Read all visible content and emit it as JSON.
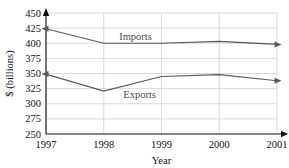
{
  "chart_data": {
    "type": "line",
    "title": "",
    "xlabel": "Year",
    "ylabel": "$ (billions)",
    "x": [
      1997,
      1998,
      1999,
      2000,
      2001
    ],
    "categories": [
      "1997",
      "1998",
      "1999",
      "2000",
      "2001"
    ],
    "xlim": [
      1997,
      2001
    ],
    "ylim": [
      250,
      450
    ],
    "yticks": [
      250,
      275,
      300,
      325,
      350,
      375,
      400,
      425,
      450
    ],
    "ytick_labels": [
      "250",
      "275",
      "300",
      "325",
      "350",
      "375",
      "400",
      "425",
      "450"
    ],
    "xtick_labels": [
      "1997",
      "1998",
      "1999",
      "2000",
      "2001"
    ],
    "grid": true,
    "legend_position": "inline-annotation",
    "series": [
      {
        "name": "Imports",
        "values": [
          424,
          400,
          400,
          403,
          398
        ],
        "color": "#595959",
        "label_text": "Imports"
      },
      {
        "name": "Exports",
        "values": [
          349,
          321,
          345,
          348,
          338
        ],
        "color": "#595959",
        "label_text": "Exports"
      }
    ],
    "annotations": [
      {
        "text": "Imports",
        "x": 1998.55,
        "y": 412
      },
      {
        "text": "Exports",
        "x": 1998.62,
        "y": 315
      }
    ],
    "colors": {
      "line": "#595959",
      "grid": "#c9c9c9",
      "axis": "#111111",
      "text": "#111111",
      "background": "#ffffff"
    }
  }
}
